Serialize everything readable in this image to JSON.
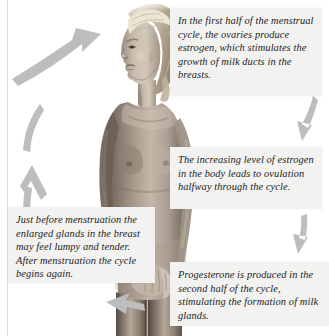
{
  "figure": {
    "background_color": "#ffffff",
    "arrow_color": "#bdbdbd",
    "caption_background": "#f2f2f0",
    "caption_text_color": "#1c1c1c"
  },
  "photo": {
    "alt": "Grayscale photograph of a nude woman standing in profile, facing left, with long light hair",
    "skin_light": "#d8cfc6",
    "skin_mid": "#a99c90",
    "skin_shadow": "#6f6358",
    "hair_light": "#e6ddcf",
    "hair_mid": "#b8ac98",
    "background": "#ffffff"
  },
  "captions": [
    {
      "id": "estrogen",
      "name": "caption-estrogen",
      "text": "In the first half of the menstrual cycle, the ovaries produce estrogen, which stimulates the growth of milk ducts in the breasts.",
      "position": "top-right"
    },
    {
      "id": "ovulation",
      "name": "caption-ovulation",
      "text": "The increasing level of estrogen in the body leads to ovulation halfway through the cycle.",
      "position": "middle-right"
    },
    {
      "id": "progesterone",
      "name": "caption-progesterone",
      "text": "Progesterone is produced in the second half of the cycle, stimulating the formation of milk glands.",
      "position": "bottom-right"
    },
    {
      "id": "menstruation",
      "name": "caption-menstruation",
      "text": "Just before menstruation the enlarged glands in the breast may feel lumpy and tender. After menstruation the cycle begins again.",
      "position": "bottom-left"
    }
  ],
  "arrows": [
    {
      "id": "top-left",
      "name": "arrow-top-left",
      "direction": "up-right",
      "description": "curved arrow from left side sweeping up toward the head"
    },
    {
      "id": "left-upper",
      "name": "arrow-left-upper",
      "direction": "up",
      "description": "curved arrow rising along the upper left"
    },
    {
      "id": "left-lower",
      "name": "arrow-left-lower",
      "direction": "up",
      "description": "curved arrow rising along the lower left"
    },
    {
      "id": "right-upper",
      "name": "arrow-right-upper",
      "direction": "down",
      "description": "curved arrow descending on the upper right"
    },
    {
      "id": "right-lower",
      "name": "arrow-right-lower",
      "direction": "down",
      "description": "curved arrow descending on the lower right"
    },
    {
      "id": "bottom",
      "name": "arrow-bottom",
      "direction": "left",
      "description": "arrow at the bottom pointing left, closing the cycle"
    }
  ]
}
